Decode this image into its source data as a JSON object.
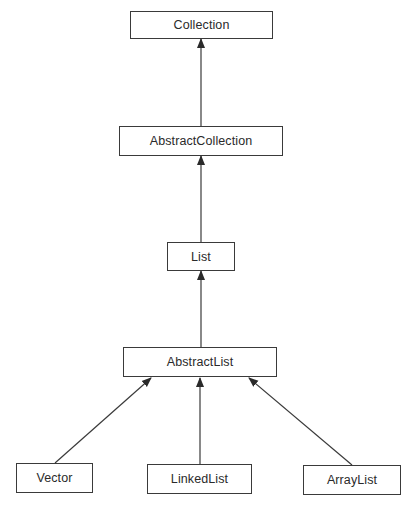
{
  "diagram": {
    "type": "class-hierarchy",
    "colors": {
      "background": "#ffffff",
      "box_border": "#3a3a3a",
      "line": "#3a3a3a",
      "text": "#2a2a2a"
    },
    "nodes": [
      {
        "id": "collection",
        "label": "Collection",
        "x": 130,
        "y": 11,
        "w": 143,
        "h": 28
      },
      {
        "id": "abstractcollection",
        "label": "AbstractCollection",
        "x": 119,
        "y": 126,
        "w": 164,
        "h": 30
      },
      {
        "id": "list",
        "label": "List",
        "x": 167,
        "y": 242,
        "w": 68,
        "h": 29
      },
      {
        "id": "abstractlist",
        "label": "AbstractList",
        "x": 123,
        "y": 347,
        "w": 154,
        "h": 30
      },
      {
        "id": "vector",
        "label": "Vector",
        "x": 16,
        "y": 463,
        "w": 77,
        "h": 30
      },
      {
        "id": "linkedlist",
        "label": "LinkedList",
        "x": 147,
        "y": 464,
        "w": 105,
        "h": 30
      },
      {
        "id": "arraylist",
        "label": "ArrayList",
        "x": 303,
        "y": 465,
        "w": 98,
        "h": 30
      }
    ],
    "edges": [
      {
        "from": "abstractcollection",
        "to": "collection",
        "x1": 201,
        "y1": 126,
        "x2": 201,
        "y2": 39,
        "arrow": "filled-triangle"
      },
      {
        "from": "list",
        "to": "abstractcollection",
        "x1": 201,
        "y1": 242,
        "x2": 201,
        "y2": 156,
        "arrow": "filled-triangle"
      },
      {
        "from": "abstractlist",
        "to": "list",
        "x1": 201,
        "y1": 347,
        "x2": 201,
        "y2": 271,
        "arrow": "filled-triangle"
      },
      {
        "from": "vector",
        "to": "abstractlist",
        "x1": 55,
        "y1": 463,
        "x2": 151,
        "y2": 378,
        "arrow": "filled-triangle"
      },
      {
        "from": "linkedlist",
        "to": "abstractlist",
        "x1": 200,
        "y1": 464,
        "x2": 200,
        "y2": 378,
        "arrow": "filled-triangle"
      },
      {
        "from": "arraylist",
        "to": "abstractlist",
        "x1": 352,
        "y1": 465,
        "x2": 249,
        "y2": 378,
        "arrow": "filled-triangle"
      }
    ]
  }
}
